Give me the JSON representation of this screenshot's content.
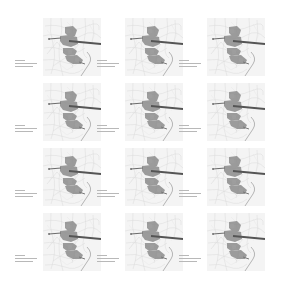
{
  "figure": {
    "layout": {
      "rows": 4,
      "cols": 3
    },
    "colors": {
      "background": "#ffffff",
      "base_map_fill": "#f3f3f3",
      "base_map_lines": "#d2d2d2",
      "district_fill": "#8e8e8e",
      "corridor_line": "#5a5a5a",
      "coast_line": "#9a9a9a"
    },
    "panels": [
      {
        "row": 0,
        "col": 0,
        "caption": ""
      },
      {
        "row": 0,
        "col": 1,
        "caption": ""
      },
      {
        "row": 0,
        "col": 2,
        "caption": ""
      },
      {
        "row": 1,
        "col": 0,
        "caption": ""
      },
      {
        "row": 1,
        "col": 1,
        "caption": ""
      },
      {
        "row": 1,
        "col": 2,
        "caption": ""
      },
      {
        "row": 2,
        "col": 0,
        "caption": ""
      },
      {
        "row": 2,
        "col": 1,
        "caption": ""
      },
      {
        "row": 2,
        "col": 2,
        "caption": ""
      },
      {
        "row": 3,
        "col": 0,
        "caption": ""
      },
      {
        "row": 3,
        "col": 1,
        "caption": ""
      },
      {
        "row": 3,
        "col": 2,
        "caption": ""
      }
    ]
  }
}
